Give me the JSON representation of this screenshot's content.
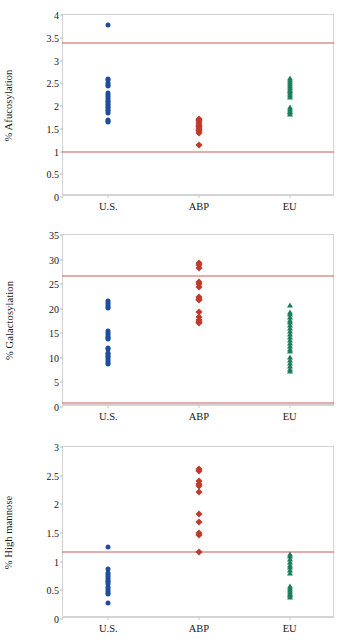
{
  "figure": {
    "categories": [
      "U.S.",
      "ABP",
      "EU"
    ],
    "series_styles": {
      "U.S.": {
        "marker": "circle",
        "color": "#1F4E9C"
      },
      "ABP": {
        "marker": "diamond",
        "color": "#C0392B"
      },
      "EU": {
        "marker": "triangle",
        "color": "#1D7D5B"
      }
    },
    "limit_line_color": "#C0504D",
    "frame_color": "#D4D4D4"
  },
  "chart_data": [
    {
      "type": "scatter",
      "title": "",
      "xlabel": "",
      "ylabel": "% Afucosylation",
      "ylim": [
        0,
        4
      ],
      "yticks": [
        0,
        0.5,
        1,
        1.5,
        2,
        2.5,
        3,
        3.5,
        4
      ],
      "ytick_labels": [
        "0",
        "0.5",
        "1",
        "1.5",
        "2",
        "2.5",
        "3",
        "3.5",
        "4"
      ],
      "grid": false,
      "legend": "none",
      "categories": [
        "U.S.",
        "ABP",
        "EU"
      ],
      "reference_lines": [
        {
          "label": "upper specification limit",
          "value": 3.38
        },
        {
          "label": "lower specification limit",
          "value": 1.0
        }
      ],
      "series": [
        {
          "name": "U.S.",
          "marker": "circle",
          "color": "#1F4E9C",
          "values": [
            3.79,
            2.6,
            2.57,
            2.5,
            2.46,
            2.43,
            2.28,
            2.24,
            2.2,
            2.16,
            2.12,
            2.09,
            2.05,
            2.02,
            1.98,
            1.95,
            1.91,
            1.88,
            1.85,
            1.7,
            1.66,
            1.64
          ]
        },
        {
          "name": "ABP",
          "marker": "diamond",
          "color": "#C0392B",
          "values": [
            1.72,
            1.69,
            1.66,
            1.62,
            1.59,
            1.56,
            1.53,
            1.5,
            1.47,
            1.44,
            1.41,
            1.15
          ]
        },
        {
          "name": "EU",
          "marker": "triangle",
          "color": "#1D7D5B",
          "values": [
            2.62,
            2.58,
            2.53,
            2.48,
            2.44,
            2.4,
            2.36,
            2.32,
            2.28,
            2.24,
            2.2,
            1.98,
            1.94,
            1.9,
            1.86,
            1.83
          ]
        }
      ]
    },
    {
      "type": "scatter",
      "title": "",
      "xlabel": "",
      "ylabel": "% Galactosylation",
      "ylim": [
        0,
        35
      ],
      "yticks": [
        0,
        5,
        10,
        15,
        20,
        25,
        30,
        35
      ],
      "ytick_labels": [
        "0",
        "5",
        "10",
        "15",
        "20",
        "25",
        "30",
        "35"
      ],
      "grid": false,
      "legend": "none",
      "categories": [
        "U.S.",
        "ABP",
        "EU"
      ],
      "reference_lines": [
        {
          "label": "upper specification limit",
          "value": 26.6
        },
        {
          "label": "lower specification limit",
          "value": 0.9
        }
      ],
      "series": [
        {
          "name": "U.S.",
          "marker": "circle",
          "color": "#1F4E9C",
          "values": [
            21.6,
            21.2,
            20.8,
            20.4,
            20.2,
            15.4,
            15.0,
            14.6,
            14.3,
            14.0,
            13.8,
            12.1,
            11.8,
            11.0,
            10.7,
            10.4,
            10.1,
            9.8,
            9.4,
            9.0,
            8.7
          ]
        },
        {
          "name": "ABP",
          "marker": "diamond",
          "color": "#C0392B",
          "values": [
            29.4,
            28.8,
            28.3,
            25.4,
            25.0,
            24.4,
            22.4,
            22.0,
            21.7,
            19.3,
            18.3,
            17.8,
            17.3,
            17.0
          ]
        },
        {
          "name": "EU",
          "marker": "triangle",
          "color": "#1D7D5B",
          "values": [
            20.8,
            19.4,
            18.9,
            18.4,
            17.8,
            17.2,
            16.6,
            16.0,
            15.4,
            14.8,
            14.2,
            13.6,
            13.0,
            12.4,
            11.9,
            11.3,
            10.2,
            9.5,
            9.0,
            8.4,
            7.8,
            7.3
          ]
        }
      ]
    },
    {
      "type": "scatter",
      "title": "",
      "xlabel": "",
      "ylabel": "% High mannose",
      "ylim": [
        0,
        3
      ],
      "yticks": [
        0,
        0.5,
        1,
        1.5,
        2,
        2.5,
        3
      ],
      "ytick_labels": [
        "0",
        "0.5",
        "1",
        "1.5",
        "2",
        "2.5",
        "3"
      ],
      "grid": false,
      "legend": "none",
      "categories": [
        "U.S.",
        "ABP",
        "EU"
      ],
      "reference_lines": [
        {
          "label": "upper specification limit",
          "value": 1.17
        }
      ],
      "series": [
        {
          "name": "U.S.",
          "marker": "circle",
          "color": "#1F4E9C",
          "values": [
            1.25,
            0.87,
            0.8,
            0.76,
            0.73,
            0.7,
            0.67,
            0.64,
            0.61,
            0.55,
            0.52,
            0.49,
            0.46,
            0.43,
            0.28
          ]
        },
        {
          "name": "ABP",
          "marker": "diamond",
          "color": "#C0392B",
          "values": [
            2.62,
            2.58,
            2.4,
            2.36,
            2.32,
            2.21,
            1.84,
            1.7,
            1.5,
            1.46,
            1.17
          ]
        },
        {
          "name": "EU",
          "marker": "triangle",
          "color": "#1D7D5B",
          "values": [
            1.14,
            1.1,
            1.05,
            1.0,
            0.95,
            0.9,
            0.85,
            0.8,
            0.58,
            0.54,
            0.5,
            0.47,
            0.44,
            0.41,
            0.38
          ]
        }
      ]
    }
  ]
}
